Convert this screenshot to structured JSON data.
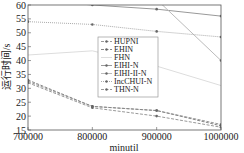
{
  "chart_data": {
    "type": "line",
    "title": "",
    "xlabel": "minutil",
    "ylabel": "运行时间/s",
    "x": [
      700000,
      800000,
      900000,
      1000000
    ],
    "xticks": [
      "700000",
      "800000",
      "900000",
      "1000000"
    ],
    "yticks": [
      "15",
      "20",
      "25",
      "30",
      "35",
      "40",
      "45",
      "50",
      "55",
      "60"
    ],
    "xlim": [
      700000,
      1000000
    ],
    "ylim": [
      15,
      60
    ],
    "grid": false,
    "legend_position": "center",
    "series": [
      {
        "name": "HUPNI",
        "values": [
          32.5,
          23.5,
          22,
          17
        ],
        "color": "#999999",
        "style": "dashed",
        "marker": "triangle"
      },
      {
        "name": "EHIN",
        "values": [
          33,
          23.5,
          22,
          16.5
        ],
        "color": "#888888",
        "style": "dashed",
        "marker": "square"
      },
      {
        "name": "FHN",
        "values": [
          42,
          43.5,
          38,
          31
        ],
        "color": "#dddddd",
        "style": "solid",
        "marker": "none"
      },
      {
        "name": "EIHI-N",
        "values": [
          62,
          60,
          58.5,
          56
        ],
        "color": "#999999",
        "style": "solid",
        "marker": "x"
      },
      {
        "name": "EIHI-II-N",
        "values": [
          70,
          68,
          62,
          40
        ],
        "color": "#bbbbbb",
        "style": "solid",
        "marker": "dot"
      },
      {
        "name": "IncCHUI-N",
        "values": [
          54,
          53,
          50.5,
          48.5
        ],
        "color": "#aaaaaa",
        "style": "dotted",
        "marker": "circle"
      },
      {
        "name": "THN-N",
        "values": [
          32,
          23,
          20,
          16
        ],
        "color": "#999999",
        "style": "dashed",
        "marker": "star"
      }
    ]
  },
  "legend": {
    "items": [
      "HUPNI",
      "EHIN",
      "FHN",
      "EIHI-N",
      "EIHI-II-N",
      "IncCHUI-N",
      "THN-N"
    ]
  },
  "axes": {
    "xlabel": "minutil",
    "ylabel": "运行时间/s"
  }
}
